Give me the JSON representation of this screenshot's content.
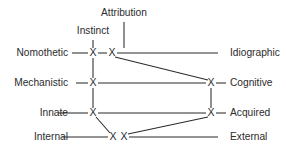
{
  "figure": {
    "background_color": "#ffffff",
    "line_color": "#2b2b2b",
    "text_color": "#2b2b2b"
  },
  "chart_data": {
    "type": "diagram",
    "rows": [
      {
        "id": "row-nomothetic-idiographic",
        "left_label": "Nomothetic",
        "right_label": "Idiographic",
        "y": 53
      },
      {
        "id": "row-mechanistic-cognitive",
        "left_label": "Mechanistic",
        "right_label": "Cognitive",
        "y": 83
      },
      {
        "id": "row-innate-acquired",
        "left_label": "Innate",
        "right_label": "Acquired",
        "y": 113
      },
      {
        "id": "row-internal-external",
        "left_label": "Internal",
        "right_label": "External",
        "y": 137
      }
    ],
    "top_labels": [
      {
        "id": "label-instinct",
        "text": "Instinct",
        "x": 93,
        "y": 31
      },
      {
        "id": "label-attribution",
        "text": "Attribution",
        "x": 124,
        "y": 13
      }
    ],
    "nodes": [
      {
        "id": "node-instinct",
        "glyph": "X",
        "x": 93,
        "y": 53
      },
      {
        "id": "node-attribution",
        "glyph": "X",
        "x": 112,
        "y": 53
      },
      {
        "id": "node-mechanistic",
        "glyph": "X",
        "x": 93,
        "y": 83
      },
      {
        "id": "node-cognitive",
        "glyph": "X",
        "x": 211,
        "y": 83
      },
      {
        "id": "node-innate",
        "glyph": "X",
        "x": 93,
        "y": 113
      },
      {
        "id": "node-acquired",
        "glyph": "X",
        "x": 211,
        "y": 113
      },
      {
        "id": "node-internal-a",
        "glyph": "X",
        "x": 113,
        "y": 137
      },
      {
        "id": "node-internal-b",
        "glyph": "X",
        "x": 124,
        "y": 137
      }
    ],
    "edges": [
      {
        "id": "edge-nomothetic-axis-left",
        "x1": 72,
        "y1": 53,
        "x2": 88,
        "y2": 53
      },
      {
        "id": "edge-nomothetic-node-link",
        "x1": 98,
        "y1": 53,
        "x2": 107,
        "y2": 53
      },
      {
        "id": "edge-nomothetic-axis-right",
        "x1": 117,
        "y1": 53,
        "x2": 218,
        "y2": 53
      },
      {
        "id": "edge-mechanistic-axis-left",
        "x1": 76,
        "y1": 83,
        "x2": 88,
        "y2": 83
      },
      {
        "id": "edge-mechanistic-axis-mid",
        "x1": 98,
        "y1": 83,
        "x2": 206,
        "y2": 83
      },
      {
        "id": "edge-cognitive-stub",
        "x1": 216,
        "y1": 83,
        "x2": 226,
        "y2": 83
      },
      {
        "id": "edge-innate-axis-left",
        "x1": 58,
        "y1": 113,
        "x2": 88,
        "y2": 113
      },
      {
        "id": "edge-innate-axis-mid",
        "x1": 98,
        "y1": 113,
        "x2": 206,
        "y2": 113
      },
      {
        "id": "edge-acquired-stub",
        "x1": 216,
        "y1": 113,
        "x2": 226,
        "y2": 113
      },
      {
        "id": "edge-internal-axis-left",
        "x1": 62,
        "y1": 137,
        "x2": 108,
        "y2": 137
      },
      {
        "id": "edge-internal-axis-right",
        "x1": 129,
        "y1": 137,
        "x2": 218,
        "y2": 137
      },
      {
        "id": "edge-instinct-stem",
        "x1": 93,
        "y1": 40,
        "x2": 93,
        "y2": 48
      },
      {
        "id": "edge-attribution-stem",
        "x1": 124,
        "y1": 22,
        "x2": 124,
        "y2": 48
      },
      {
        "id": "edge-left-column-upper",
        "x1": 93,
        "y1": 58,
        "x2": 93,
        "y2": 78
      },
      {
        "id": "edge-left-column-lower",
        "x1": 93,
        "y1": 88,
        "x2": 93,
        "y2": 108
      },
      {
        "id": "edge-right-column",
        "x1": 211,
        "y1": 88,
        "x2": 211,
        "y2": 108
      },
      {
        "id": "edge-diag-attribution-cognitive",
        "x1": 115,
        "y1": 57,
        "x2": 208,
        "y2": 80
      },
      {
        "id": "edge-diag-innate-internal",
        "x1": 96,
        "y1": 117,
        "x2": 110,
        "y2": 133
      },
      {
        "id": "edge-diag-acquired-internal",
        "x1": 208,
        "y1": 117,
        "x2": 128,
        "y2": 134
      }
    ],
    "label_positions": {
      "left_x": 68,
      "right_x": 230
    }
  }
}
